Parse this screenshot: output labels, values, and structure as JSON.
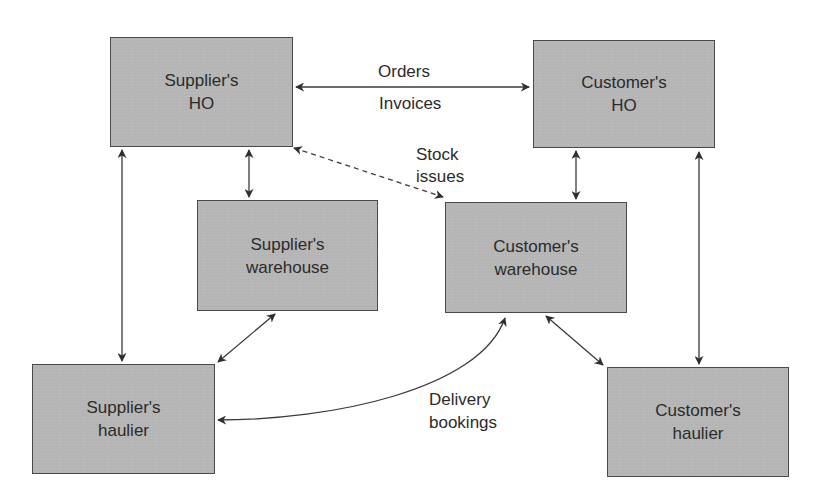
{
  "diagram": {
    "nodes": [
      {
        "id": "supplier-ho",
        "line1": "Supplier's",
        "line2": "HO"
      },
      {
        "id": "customer-ho",
        "line1": "Customer's",
        "line2": "HO"
      },
      {
        "id": "supplier-warehouse",
        "line1": "Supplier's",
        "line2": "warehouse"
      },
      {
        "id": "customer-warehouse",
        "line1": "Customer's",
        "line2": "warehouse"
      },
      {
        "id": "supplier-haulier",
        "line1": "Supplier's",
        "line2": "haulier"
      },
      {
        "id": "customer-haulier",
        "line1": "Customer's",
        "line2": "haulier"
      }
    ],
    "edge_labels": {
      "orders": "Orders",
      "invoices": "Invoices",
      "stock_line1": "Stock",
      "stock_line2": "issues",
      "delivery_line1": "Delivery",
      "delivery_line2": "bookings"
    },
    "edges": [
      {
        "from": "supplier-ho",
        "to": "customer-ho",
        "style": "solid",
        "bidirectional": true,
        "label": "Orders / Invoices"
      },
      {
        "from": "supplier-ho",
        "to": "customer-warehouse",
        "style": "dashed",
        "bidirectional": true,
        "label": "Stock issues"
      },
      {
        "from": "supplier-ho",
        "to": "supplier-warehouse",
        "style": "solid",
        "bidirectional": true
      },
      {
        "from": "supplier-ho",
        "to": "supplier-haulier",
        "style": "solid",
        "bidirectional": true
      },
      {
        "from": "customer-ho",
        "to": "customer-warehouse",
        "style": "solid",
        "bidirectional": true
      },
      {
        "from": "customer-ho",
        "to": "customer-haulier",
        "style": "solid",
        "bidirectional": true
      },
      {
        "from": "supplier-warehouse",
        "to": "supplier-haulier",
        "style": "solid",
        "bidirectional": true
      },
      {
        "from": "customer-warehouse",
        "to": "customer-haulier",
        "style": "solid",
        "bidirectional": true
      },
      {
        "from": "supplier-haulier",
        "to": "customer-warehouse",
        "style": "curved",
        "bidirectional": true,
        "label": "Delivery bookings"
      }
    ],
    "colors": {
      "box_fill": "#b5b5b5",
      "box_border": "#4a4a4a",
      "line": "#333333",
      "background": "#ffffff"
    }
  }
}
